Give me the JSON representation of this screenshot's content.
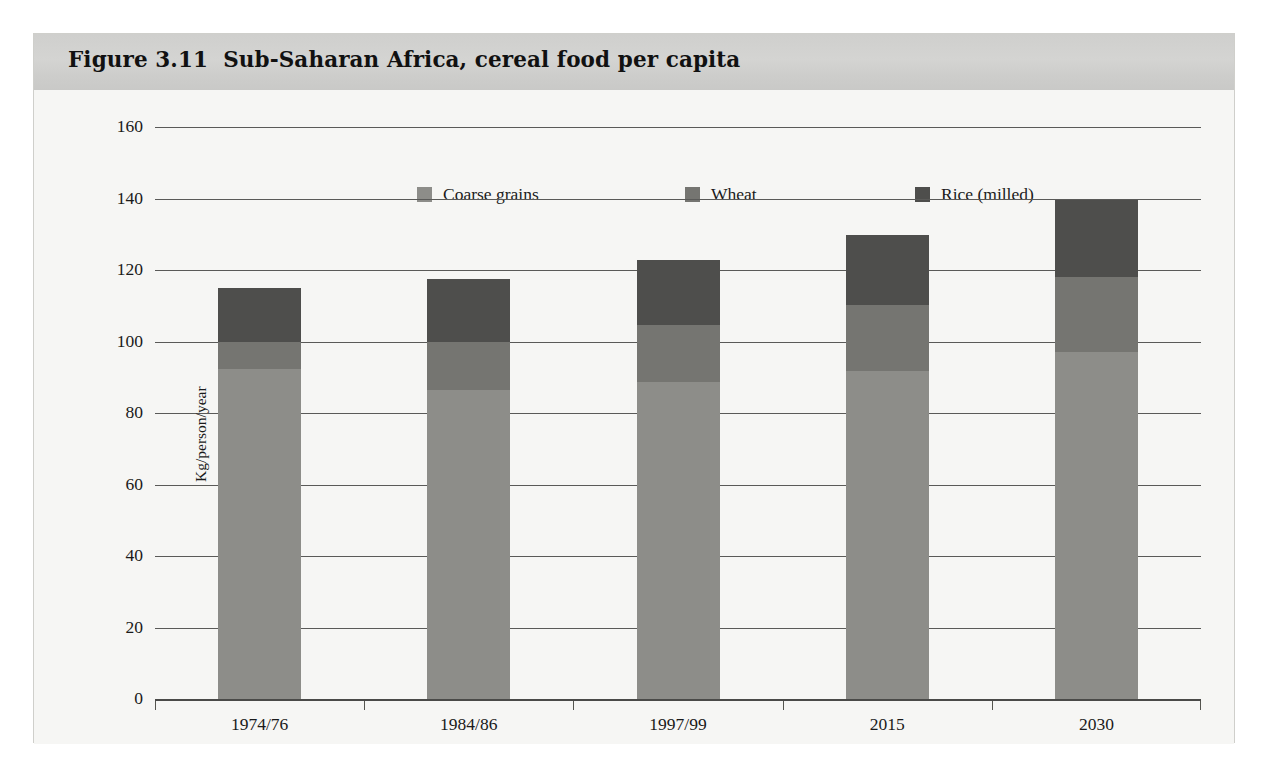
{
  "figure": {
    "title": "Figure 3.11  Sub-Saharan Africa, cereal food per capita",
    "band_color": "#d1d1cf",
    "background": "#f6f6f4"
  },
  "chart_data": {
    "type": "bar",
    "stacked": true,
    "title": "Figure 3.11  Sub-Saharan Africa, cereal food per capita",
    "xlabel": "",
    "ylabel": "Kg/person/year",
    "ylim": [
      0,
      160
    ],
    "ytick_step": 20,
    "yticks": [
      0,
      20,
      40,
      60,
      80,
      100,
      120,
      140,
      160
    ],
    "grid": true,
    "legend_position": "top-center",
    "categories": [
      "1974/76",
      "1984/86",
      "1997/99",
      "2015",
      "2030"
    ],
    "series": [
      {
        "name": "Coarse grains",
        "color": "#8d8d89",
        "values": [
          92.3,
          86.5,
          88.7,
          91.7,
          97.0
        ]
      },
      {
        "name": "Wheat",
        "color": "#757571",
        "values": [
          7.7,
          13.5,
          16.0,
          18.5,
          21.0
        ]
      },
      {
        "name": "Rice (milled)",
        "color": "#4e4e4c",
        "values": [
          15.0,
          17.5,
          18.0,
          19.5,
          21.5
        ]
      }
    ],
    "totals": [
      115.0,
      117.5,
      122.7,
      129.7,
      139.5
    ]
  },
  "legend": {
    "items": [
      {
        "label": "Coarse grains",
        "color": "#8d8d89",
        "swatch": "legend-swatch-coarse-grains"
      },
      {
        "label": "Wheat",
        "color": "#757571",
        "swatch": "legend-swatch-wheat"
      },
      {
        "label": "Rice (milled)",
        "color": "#4e4e4c",
        "swatch": "legend-swatch-rice-milled"
      }
    ]
  },
  "yaxis": {
    "title": "Kg/person/year",
    "ticks": [
      "160",
      "140",
      "120",
      "100",
      "80",
      "60",
      "40",
      "20",
      "0"
    ]
  },
  "xaxis": {
    "ticks": [
      "1974/76",
      "1984/86",
      "1997/99",
      "2015",
      "2030"
    ]
  }
}
